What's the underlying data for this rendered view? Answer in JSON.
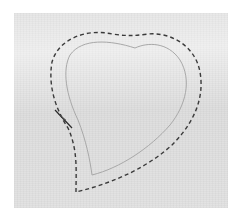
{
  "image": {
    "subject": "Fabric with heart-shaped pattern outline and dashed stitching line",
    "colors": {
      "background": "#ffffff",
      "fabric": "#e7e7e7",
      "outline": "#a8a8a8",
      "stitch": "#3a3a3a"
    }
  }
}
